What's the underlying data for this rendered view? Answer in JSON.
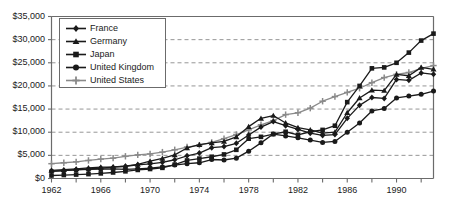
{
  "chart_data": {
    "type": "line",
    "title": "",
    "subtitle": "",
    "xlabel": "",
    "ylabel": "",
    "grid": true,
    "grid_axis": "y",
    "legend_position": "top-left-inside",
    "xlim": [
      1962,
      1993
    ],
    "ylim": [
      0,
      35000
    ],
    "ytick_values": [
      0,
      5000,
      10000,
      15000,
      20000,
      25000,
      30000,
      35000
    ],
    "ytick_labels": [
      "$0",
      "$5,000",
      "$10,000",
      "$15,000",
      "$20,000",
      "$25,000",
      "$30,000",
      "$35,000"
    ],
    "xtick_values": [
      1962,
      1964,
      1966,
      1968,
      1970,
      1972,
      1974,
      1976,
      1978,
      1980,
      1982,
      1984,
      1986,
      1988,
      1990,
      1992
    ],
    "xtick_labels_shown": [
      "1962",
      "1966",
      "1970",
      "1974",
      "1978",
      "1982",
      "1986",
      "1990"
    ],
    "xtick_label_values": [
      1962,
      1966,
      1970,
      1974,
      1978,
      1982,
      1986,
      1990
    ],
    "x": [
      1962,
      1963,
      1964,
      1965,
      1966,
      1967,
      1968,
      1969,
      1970,
      1971,
      1972,
      1973,
      1974,
      1975,
      1976,
      1977,
      1978,
      1979,
      1980,
      1981,
      1982,
      1983,
      1984,
      1985,
      1986,
      1987,
      1988,
      1989,
      1990,
      1991,
      1992,
      1993
    ],
    "series": [
      {
        "name": "France",
        "marker": "diamond",
        "color": "#1a1a1a",
        "values": [
          1550,
          1700,
          1900,
          2050,
          2250,
          2450,
          2650,
          2950,
          3150,
          3500,
          4050,
          4900,
          5500,
          6650,
          6900,
          7600,
          9400,
          11100,
          12300,
          11400,
          10600,
          9800,
          9300,
          9500,
          13000,
          15800,
          17500,
          17300,
          21400,
          21200,
          22800,
          22500
        ]
      },
      {
        "name": "Germany",
        "marker": "triangle",
        "color": "#1a1a1a",
        "values": [
          1750,
          1900,
          2100,
          2300,
          2450,
          2500,
          2650,
          3050,
          3750,
          4350,
          5100,
          6600,
          7300,
          7700,
          8000,
          9000,
          11200,
          13000,
          13600,
          12000,
          11000,
          10500,
          9800,
          10000,
          14200,
          17400,
          19100,
          19000,
          22500,
          22200,
          24000,
          23600
        ]
      },
      {
        "name": "Japan",
        "marker": "square",
        "color": "#1a1a1a",
        "values": [
          650,
          750,
          850,
          950,
          1100,
          1300,
          1550,
          1850,
          2050,
          2300,
          3000,
          3900,
          4300,
          4700,
          5200,
          6200,
          8600,
          9000,
          9600,
          10100,
          9400,
          10100,
          10500,
          11400,
          16500,
          20000,
          23800,
          24000,
          25000,
          27200,
          29800,
          31300
        ]
      },
      {
        "name": "United Kingdom",
        "marker": "circle",
        "color": "#1a1a1a",
        "values": [
          1600,
          1700,
          1850,
          1950,
          2050,
          2100,
          1950,
          2100,
          2250,
          2500,
          2900,
          3200,
          3400,
          4100,
          4000,
          4400,
          5900,
          7700,
          9600,
          9200,
          8800,
          8300,
          7800,
          8000,
          10000,
          12000,
          14600,
          15100,
          17400,
          17800,
          18200,
          18900
        ]
      },
      {
        "name": "United States",
        "marker": "plus",
        "color": "#8a8a8a",
        "values": [
          3200,
          3400,
          3600,
          3900,
          4200,
          4400,
          4800,
          5100,
          5300,
          5700,
          6200,
          6800,
          7200,
          7800,
          8600,
          9500,
          10500,
          11600,
          12500,
          13800,
          14200,
          15200,
          16700,
          17700,
          18600,
          19500,
          20700,
          21800,
          22500,
          22900,
          23800,
          24400
        ]
      }
    ]
  },
  "axes": {
    "ylabels": [
      "$35,000",
      "$30,000",
      "$25,000",
      "$20,000",
      "$15,000",
      "$10,000",
      "$5,000",
      "$0"
    ],
    "xlabels": [
      "1962",
      "1966",
      "1970",
      "1974",
      "1978",
      "1982",
      "1986",
      "1990"
    ]
  },
  "legend": {
    "items": [
      {
        "label": "France",
        "marker": "diamond-marker",
        "color": "#1a1a1a"
      },
      {
        "label": "Germany",
        "marker": "triangle-marker",
        "color": "#1a1a1a"
      },
      {
        "label": "Japan",
        "marker": "square-marker",
        "color": "#1a1a1a"
      },
      {
        "label": "United Kingdom",
        "marker": "circle-marker",
        "color": "#1a1a1a"
      },
      {
        "label": "United States",
        "marker": "plus-marker",
        "color": "#8a8a8a"
      }
    ]
  },
  "style": {
    "axis_color": "#6b6b6b",
    "grid_color": "#8a8a8a",
    "text_color": "#1a1a1a",
    "background": "#ffffff"
  }
}
